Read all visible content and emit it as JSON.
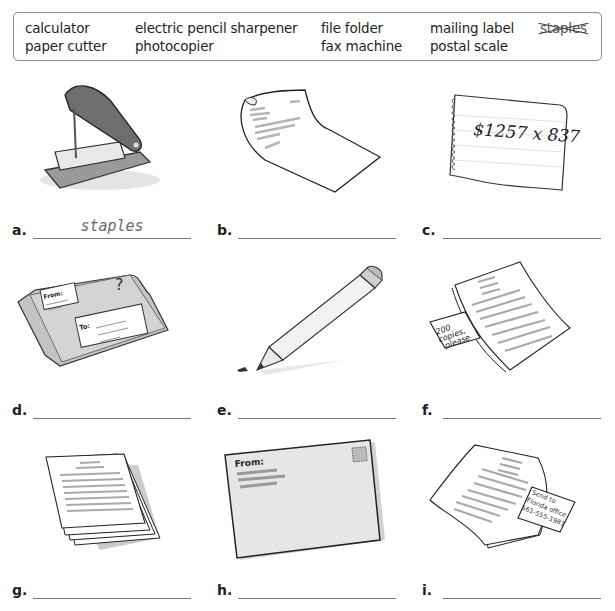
{
  "word_box": {
    "words": [
      {
        "text": "calculator",
        "crossed": false
      },
      {
        "text": "electric pencil sharpener",
        "crossed": false
      },
      {
        "text": "file folder",
        "crossed": false
      },
      {
        "text": "mailing label",
        "crossed": false
      },
      {
        "text": "staples",
        "crossed": true
      },
      {
        "text": "paper cutter",
        "crossed": false
      },
      {
        "text": "photocopier",
        "crossed": false
      },
      {
        "text": "fax machine",
        "crossed": false
      },
      {
        "text": "postal scale",
        "crossed": false
      }
    ]
  },
  "items": [
    {
      "letter": "a.",
      "answer": "staples",
      "picture": "stapler-remover-icon"
    },
    {
      "letter": "b.",
      "answer": "",
      "picture": "curled-letter-icon"
    },
    {
      "letter": "c.",
      "answer": "",
      "picture": "notepad-calculation-icon",
      "note_text": "$1257 x 837"
    },
    {
      "letter": "d.",
      "answer": "",
      "picture": "package-icon",
      "from_label": "From:",
      "to_label": "To:",
      "mark": "?"
    },
    {
      "letter": "e.",
      "answer": "",
      "picture": "pencil-icon"
    },
    {
      "letter": "f.",
      "answer": "",
      "picture": "document-note-icon",
      "note_text": [
        "200",
        "copies,",
        "please"
      ]
    },
    {
      "letter": "g.",
      "answer": "",
      "picture": "paper-stack-icon"
    },
    {
      "letter": "h.",
      "answer": "",
      "picture": "envelope-icon",
      "from_label": "From:"
    },
    {
      "letter": "i.",
      "answer": "",
      "picture": "document-fax-note-icon",
      "note_text": [
        "Send to",
        "Florida office",
        "561-555-1981"
      ]
    }
  ],
  "colors": {
    "ink": "#231f20",
    "border": "#8c8c8c",
    "answer_text": "#6a6a6a",
    "gray_fill": "#c8c8c8"
  }
}
